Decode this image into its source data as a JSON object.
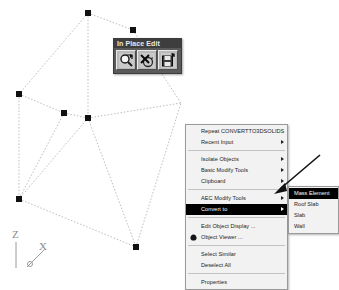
{
  "app": {
    "viewport_background": "#ffffff",
    "wire_color": "#bdbdbd",
    "grip_color": "#111111",
    "highlight_color": "#000000",
    "highlight_text_color": "#ffffff",
    "menu_background": "#f2f2f2",
    "toolbar_background": "#5a5a5a"
  },
  "ucs": {
    "z_label": "Z",
    "x_label": "X",
    "y_label": "y"
  },
  "toolbar": {
    "title": "In Place Edit",
    "buttons": [
      {
        "label": "Zoom To",
        "icon": "magnifier-icon"
      },
      {
        "label": "Discard All Changes",
        "icon": "discard-x-icon"
      },
      {
        "label": "Save All Changes",
        "icon": "save-disk-icon"
      }
    ]
  },
  "context_menu": {
    "items": [
      {
        "label": "Repeat CONVERTTO3DSOLIDS",
        "submenu": false,
        "selected": false,
        "icon": null
      },
      {
        "label": "Recent Input",
        "submenu": true,
        "selected": false,
        "icon": null
      },
      {
        "separator": true
      },
      {
        "label": "Isolate Objects",
        "submenu": true,
        "selected": false,
        "icon": null
      },
      {
        "label": "Basic Modify Tools",
        "submenu": true,
        "selected": false,
        "icon": null
      },
      {
        "label": "Clipboard",
        "submenu": true,
        "selected": false,
        "icon": null
      },
      {
        "separator": true
      },
      {
        "label": "AEC Modify Tools",
        "submenu": true,
        "selected": false,
        "icon": null
      },
      {
        "label": "Convert to",
        "submenu": true,
        "selected": true,
        "icon": null
      },
      {
        "separator": true
      },
      {
        "label": "Edit Object Display ...",
        "submenu": false,
        "selected": false,
        "icon": null
      },
      {
        "label": "Object Viewer ...",
        "submenu": false,
        "selected": false,
        "icon": "object-viewer-icon"
      },
      {
        "separator": true
      },
      {
        "label": "Select Similar",
        "submenu": false,
        "selected": false,
        "icon": null
      },
      {
        "label": "Deselect All",
        "submenu": false,
        "selected": false,
        "icon": null
      },
      {
        "separator": true
      },
      {
        "label": "Properties",
        "submenu": false,
        "selected": false,
        "icon": null
      }
    ]
  },
  "submenu": {
    "items": [
      {
        "label": "Mass Element",
        "selected": true
      },
      {
        "label": "Roof Slab",
        "selected": false
      },
      {
        "label": "Slab",
        "selected": false
      },
      {
        "label": "Wall",
        "selected": false
      }
    ]
  },
  "geometry": {
    "grips": [
      {
        "x": 88,
        "y": 13
      },
      {
        "x": 133,
        "y": 30
      },
      {
        "x": 19,
        "y": 94
      },
      {
        "x": 64,
        "y": 113
      },
      {
        "x": 88,
        "y": 118
      },
      {
        "x": 19,
        "y": 199
      },
      {
        "x": 136,
        "y": 247
      }
    ],
    "edges": [
      [
        88,
        13,
        133,
        30
      ],
      [
        88,
        13,
        19,
        94
      ],
      [
        88,
        13,
        88,
        118
      ],
      [
        133,
        30,
        181,
        103
      ],
      [
        19,
        94,
        64,
        113
      ],
      [
        19,
        94,
        19,
        199
      ],
      [
        64,
        113,
        88,
        118
      ],
      [
        88,
        118,
        181,
        103
      ],
      [
        88,
        118,
        19,
        199
      ],
      [
        88,
        118,
        136,
        247
      ],
      [
        19,
        199,
        136,
        247
      ],
      [
        136,
        247,
        181,
        103
      ],
      [
        64,
        113,
        19,
        199
      ]
    ]
  }
}
